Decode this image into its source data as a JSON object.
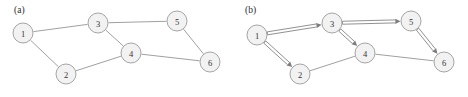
{
  "figure": {
    "width": 468,
    "height": 97,
    "background_color": "#ffffff",
    "node_fill_color": "#f2f2f2",
    "node_stroke_color": "#9b9b9b",
    "edge_color": "#8f8f8f",
    "label_color": "#333333"
  },
  "panels": [
    {
      "id": "panel-a",
      "label": "(a)",
      "label_x": 14,
      "label_y": 13,
      "graph_type": "undirected",
      "node_radius": 10,
      "nodes": [
        {
          "id": "1",
          "label": "1",
          "x": 23,
          "y": 33
        },
        {
          "id": "2",
          "label": "2",
          "x": 66,
          "y": 74
        },
        {
          "id": "3",
          "label": "3",
          "x": 98,
          "y": 23
        },
        {
          "id": "4",
          "label": "4",
          "x": 131,
          "y": 53
        },
        {
          "id": "5",
          "label": "5",
          "x": 177,
          "y": 21
        },
        {
          "id": "6",
          "label": "6",
          "x": 210,
          "y": 62
        }
      ],
      "edges": [
        {
          "from": "1",
          "to": "3",
          "directed": false,
          "doubled": false
        },
        {
          "from": "1",
          "to": "2",
          "directed": false,
          "doubled": false
        },
        {
          "from": "3",
          "to": "5",
          "directed": false,
          "doubled": false
        },
        {
          "from": "3",
          "to": "4",
          "directed": false,
          "doubled": false
        },
        {
          "from": "2",
          "to": "4",
          "directed": false,
          "doubled": false
        },
        {
          "from": "4",
          "to": "6",
          "directed": false,
          "doubled": false
        },
        {
          "from": "5",
          "to": "6",
          "directed": false,
          "doubled": false
        }
      ]
    },
    {
      "id": "panel-b",
      "label": "(b)",
      "label_x": 245,
      "label_y": 13,
      "graph_type": "directed-spanning-tree",
      "node_radius": 10,
      "nodes": [
        {
          "id": "1",
          "label": "1",
          "x": 257,
          "y": 35
        },
        {
          "id": "2",
          "label": "2",
          "x": 300,
          "y": 74
        },
        {
          "id": "3",
          "label": "3",
          "x": 332,
          "y": 23
        },
        {
          "id": "4",
          "label": "4",
          "x": 365,
          "y": 53
        },
        {
          "id": "5",
          "label": "5",
          "x": 411,
          "y": 21
        },
        {
          "id": "6",
          "label": "6",
          "x": 444,
          "y": 62
        }
      ],
      "edges": [
        {
          "from": "1",
          "to": "3",
          "directed": true,
          "doubled": true
        },
        {
          "from": "1",
          "to": "2",
          "directed": true,
          "doubled": true
        },
        {
          "from": "3",
          "to": "5",
          "directed": true,
          "doubled": true
        },
        {
          "from": "3",
          "to": "4",
          "directed": true,
          "doubled": true
        },
        {
          "from": "5",
          "to": "6",
          "directed": true,
          "doubled": true
        },
        {
          "from": "2",
          "to": "4",
          "directed": false,
          "doubled": false
        },
        {
          "from": "4",
          "to": "6",
          "directed": false,
          "doubled": false
        }
      ]
    }
  ]
}
